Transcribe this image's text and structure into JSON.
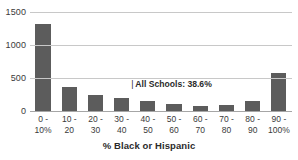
{
  "chart_data": {
    "type": "bar",
    "title": "",
    "xlabel": "% Black or Hispanic",
    "ylabel": "",
    "categories": [
      "0 - 10%",
      "10 - 20",
      "20 - 30",
      "30 - 40",
      "40 - 50",
      "50 - 60",
      "60 - 70",
      "70 - 80",
      "80 - 90",
      "90 - 100%"
    ],
    "category_lines": [
      {
        "line1": "0 -",
        "line2": "10%"
      },
      {
        "line1": "10 -",
        "line2": "20"
      },
      {
        "line1": "20 -",
        "line2": "30"
      },
      {
        "line1": "30 -",
        "line2": "40"
      },
      {
        "line1": "40 -",
        "line2": "50"
      },
      {
        "line1": "50 -",
        "line2": "60"
      },
      {
        "line1": "60 -",
        "line2": "70"
      },
      {
        "line1": "70 -",
        "line2": "80"
      },
      {
        "line1": "80 -",
        "line2": "90"
      },
      {
        "line1": "90 -",
        "line2": "100%"
      }
    ],
    "values": [
      1320,
      370,
      250,
      190,
      150,
      100,
      75,
      85,
      150,
      570
    ],
    "ylim": [
      0,
      1500
    ],
    "ytick_labels": [
      "0",
      "500",
      "1000",
      "1500"
    ],
    "ytick_values": [
      0,
      500,
      1000,
      1500
    ],
    "grid": "horizontal",
    "legend": "none",
    "bar_color": "#5c5c5c",
    "gridline_color": "#c8c8c8",
    "annotations": [
      {
        "marker": "|",
        "text": "All Schools: 38.6%",
        "value": 38.6
      }
    ]
  }
}
